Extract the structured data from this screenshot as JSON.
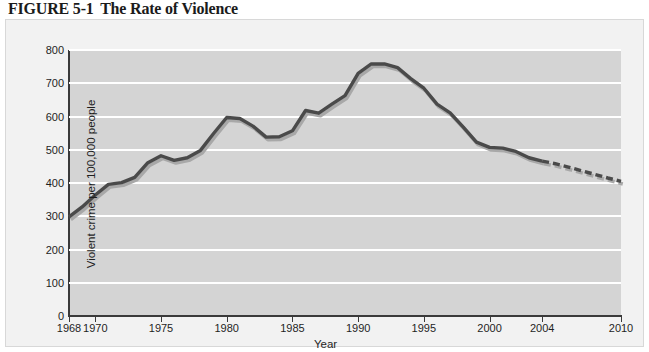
{
  "figure": {
    "number": "FIGURE 5-1",
    "title": "The Rate of Violence"
  },
  "chart_data": {
    "type": "line",
    "title": "The Rate of Violence",
    "xlabel": "Year",
    "ylabel": "Violent crime per 100,000 people",
    "xlim": [
      1968,
      2010
    ],
    "ylim": [
      0,
      800
    ],
    "ytick_labels": [
      "800",
      "700",
      "600",
      "500",
      "400",
      "300",
      "200",
      "100",
      "0"
    ],
    "yticks": [
      800,
      700,
      600,
      500,
      400,
      300,
      200,
      100,
      0
    ],
    "xtick_labels": [
      "1968",
      "1970",
      "1975",
      "1980",
      "1985",
      "1990",
      "1995",
      "2000",
      "2004",
      "2010"
    ],
    "xticks": [
      1968,
      1970,
      1975,
      1980,
      1985,
      1990,
      1995,
      2000,
      2004,
      2010
    ],
    "grid": "horizontal",
    "legend": "none",
    "plot_background": "#d4d4d4",
    "gridline_color": "#ffffff",
    "line_color": "#4a4a4a",
    "shadow_color": "#a8a8a8",
    "series": [
      {
        "name": "Violent crime rate (reported)",
        "style": "solid",
        "x": [
          1968,
          1969,
          1970,
          1971,
          1972,
          1973,
          1974,
          1975,
          1976,
          1977,
          1978,
          1979,
          1980,
          1981,
          1982,
          1983,
          1984,
          1985,
          1986,
          1987,
          1988,
          1989,
          1990,
          1991,
          1992,
          1993,
          1994,
          1995,
          1996,
          1997,
          1998,
          1999,
          2000,
          2001,
          2002,
          2003,
          2004
        ],
        "values": [
          298,
          328,
          364,
          396,
          401,
          417,
          461,
          482,
          468,
          476,
          498,
          549,
          597,
          594,
          571,
          538,
          539,
          557,
          618,
          610,
          637,
          663,
          730,
          758,
          758,
          747,
          714,
          685,
          637,
          611,
          568,
          523,
          507,
          505,
          495,
          476,
          466
        ]
      },
      {
        "name": "Violent crime rate (projected)",
        "style": "dashed",
        "x": [
          2004,
          2005,
          2006,
          2007,
          2008,
          2009,
          2010
        ],
        "values": [
          466,
          458,
          448,
          437,
          426,
          415,
          405
        ]
      }
    ]
  }
}
